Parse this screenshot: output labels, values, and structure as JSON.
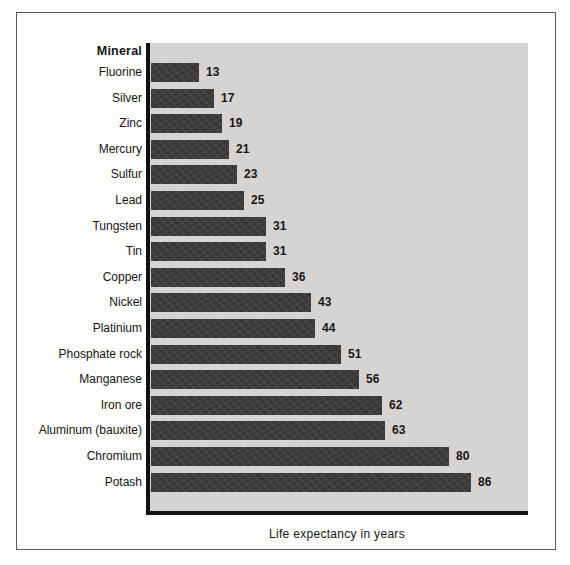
{
  "chart_data": {
    "type": "bar",
    "orientation": "horizontal",
    "header": "Mineral",
    "xlabel": "Life expectancy in years",
    "categories": [
      "Fluorine",
      "Silver",
      "Zinc",
      "Mercury",
      "Sulfur",
      "Lead",
      "Tungsten",
      "Tin",
      "Copper",
      "Nickel",
      "Platinium",
      "Phosphate rock",
      "Manganese",
      "Iron ore",
      "Aluminum (bauxite)",
      "Chromium",
      "Potash"
    ],
    "values": [
      13,
      17,
      19,
      21,
      23,
      25,
      31,
      31,
      36,
      43,
      44,
      51,
      56,
      62,
      63,
      80,
      86
    ],
    "xlim": [
      0,
      101
    ],
    "grid": false,
    "legend": "none",
    "colors": {
      "bar": "#3e3d3b",
      "plot_background": "#d5d4d2",
      "axis": "#111111",
      "frame_border": "#5a5a5a",
      "page_background": "#fdfdfc",
      "text": "#161616"
    }
  }
}
